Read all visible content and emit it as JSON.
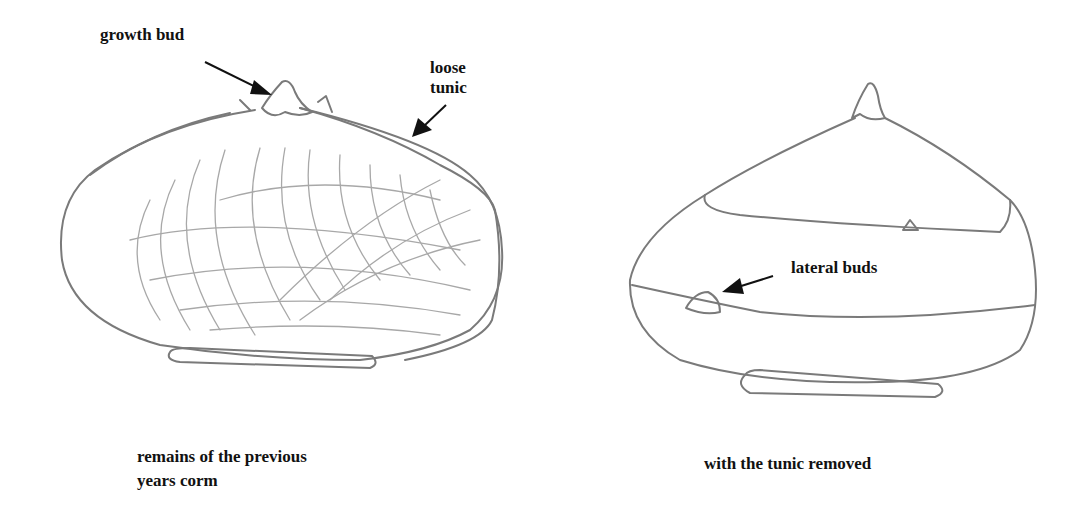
{
  "figure": {
    "type": "botanical-sketch",
    "panels": [
      {
        "id": "left",
        "subject": "corm with loose tunic",
        "caption": [
          "remains of the previous",
          "years corm"
        ],
        "annotations": [
          {
            "label": "growth bud"
          },
          {
            "label": "loose tunic",
            "lines": [
              "loose",
              "tunic"
            ]
          }
        ]
      },
      {
        "id": "right",
        "subject": "corm with tunic removed",
        "caption": [
          "with the tunic removed"
        ],
        "annotations": [
          {
            "label": "lateral buds"
          }
        ]
      }
    ],
    "colors": {
      "background": "#ffffff",
      "pencil": "#7a7a7a",
      "text": "#111111"
    }
  }
}
